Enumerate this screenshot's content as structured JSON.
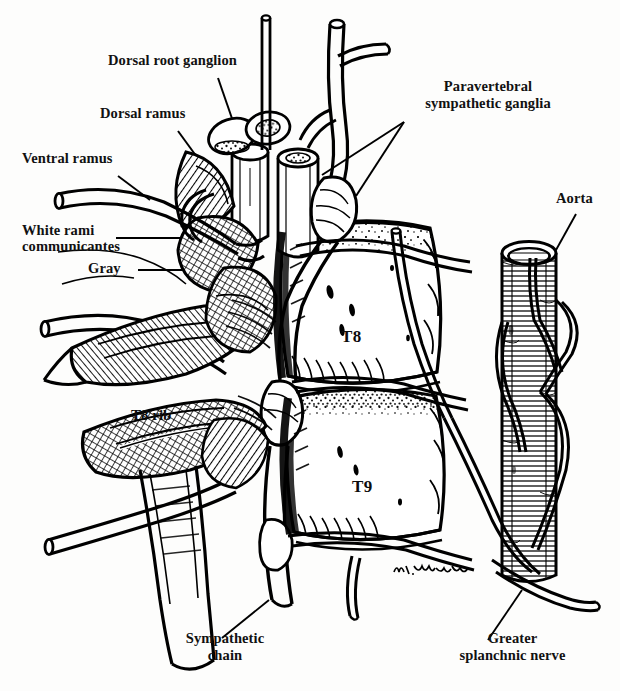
{
  "figure": {
    "background_color": "#fdfdfc",
    "ink_color": "#000000",
    "width": 620,
    "height": 691,
    "signature": "W. Hambleton"
  },
  "labels": {
    "dorsal_root_ganglion": "Dorsal root ganglion",
    "dorsal_ramus": "Dorsal ramus",
    "ventral_ramus": "Ventral ramus",
    "white_rami_line1": "White rami",
    "white_rami_line2": "communicantes",
    "gray": "Gray",
    "paravertebral_line1": "Paravertebral",
    "paravertebral_line2": "sympathetic ganglia",
    "aorta": "Aorta",
    "t8_rib": "T8 rib",
    "sympathetic_line1": "Sympathetic",
    "sympathetic_line2": "chain",
    "greater_splanchnic_line1": "Greater",
    "greater_splanchnic_line2": "splanchnic nerve"
  },
  "vertebrae": {
    "t8": "T8",
    "t9": "T9"
  }
}
